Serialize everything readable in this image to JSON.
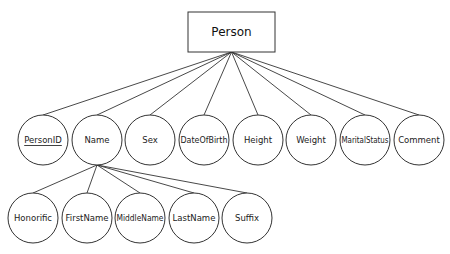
{
  "diagram": {
    "type": "er-attribute-tree",
    "root": {
      "label": "Person",
      "shape": "rectangle",
      "x": 188,
      "y": 12,
      "w": 87,
      "h": 40
    },
    "attributes": [
      {
        "label": "PersonID",
        "key": true,
        "cx": 43,
        "cy": 140
      },
      {
        "label": "Name",
        "key": false,
        "cx": 97,
        "cy": 140
      },
      {
        "label": "Sex",
        "key": false,
        "cx": 150,
        "cy": 140
      },
      {
        "label": "DateOfBirth",
        "key": false,
        "cx": 204,
        "cy": 140
      },
      {
        "label": "Height",
        "key": false,
        "cx": 258,
        "cy": 140
      },
      {
        "label": "Weight",
        "key": false,
        "cx": 311,
        "cy": 140
      },
      {
        "label": "MaritalStatus",
        "key": false,
        "cx": 365,
        "cy": 140
      },
      {
        "label": "Comment",
        "key": false,
        "cx": 419,
        "cy": 140
      }
    ],
    "name_components": [
      {
        "label": "Honorific",
        "cx": 33,
        "cy": 218
      },
      {
        "label": "FirstName",
        "cx": 87,
        "cy": 218
      },
      {
        "label": "MiddleName",
        "cx": 140,
        "cy": 218
      },
      {
        "label": "LastName",
        "cx": 194,
        "cy": 218
      },
      {
        "label": "Suffix",
        "cx": 247,
        "cy": 218
      }
    ],
    "radius": 25,
    "colors": {
      "stroke": "#333333",
      "fill": "#ffffff",
      "text": "#222222"
    }
  }
}
